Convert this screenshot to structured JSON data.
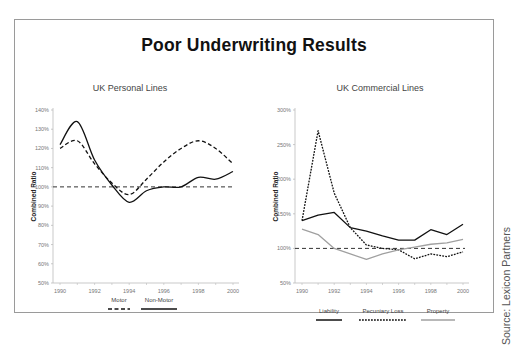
{
  "title": "Poor Underwriting Results",
  "source": "Source: Lexicon Partners",
  "colors": {
    "dark": "#111111",
    "gray": "#a0a0a0",
    "reference": "#333333"
  },
  "chart_data": [
    {
      "type": "line",
      "title": "UK Personal Lines",
      "xlabel": "",
      "ylabel": "Combined Ratio",
      "x": [
        1990,
        1991,
        1992,
        1993,
        1994,
        1995,
        1996,
        1997,
        1998,
        1999,
        2000
      ],
      "xticks": [
        "1990",
        "1992",
        "1994",
        "1996",
        "1998",
        "2000"
      ],
      "yticks": [
        "50%",
        "60%",
        "70%",
        "80%",
        "90%",
        "100%",
        "110%",
        "120%",
        "130%",
        "140%"
      ],
      "ylim": [
        50,
        140
      ],
      "reference_line": 100,
      "grid": false,
      "legend_position": "bottom",
      "series": [
        {
          "name": "Motor",
          "style": "dashed",
          "color": "#111111",
          "values": [
            120,
            124,
            112,
            102,
            96,
            104,
            113,
            120,
            124,
            120,
            112
          ]
        },
        {
          "name": "Non-Motor",
          "style": "solid",
          "color": "#111111",
          "values": [
            122,
            134,
            114,
            101,
            92,
            98,
            100,
            100,
            105,
            104,
            108
          ]
        }
      ]
    },
    {
      "type": "line",
      "title": "UK Commercial Lines",
      "xlabel": "",
      "ylabel": "Combined Ratio",
      "x": [
        1990,
        1991,
        1992,
        1993,
        1994,
        1995,
        1996,
        1997,
        1998,
        1999,
        2000
      ],
      "xticks": [
        "1990",
        "1992",
        "1994",
        "1996",
        "1998",
        "2000"
      ],
      "yticks": [
        "50%",
        "100%",
        "150%",
        "200%",
        "250%",
        "300%"
      ],
      "ylim": [
        50,
        300
      ],
      "reference_line": 100,
      "grid": false,
      "legend_position": "bottom",
      "series": [
        {
          "name": "Liability",
          "style": "solid",
          "color": "#111111",
          "values": [
            140,
            148,
            152,
            130,
            125,
            118,
            112,
            112,
            127,
            120,
            135
          ]
        },
        {
          "name": "Pecuniary Loss",
          "style": "dotted",
          "color": "#111111",
          "values": [
            140,
            270,
            180,
            130,
            105,
            100,
            98,
            85,
            92,
            88,
            95
          ]
        },
        {
          "name": "Property",
          "style": "solid",
          "color": "#a0a0a0",
          "values": [
            128,
            120,
            100,
            92,
            84,
            92,
            98,
            102,
            106,
            108,
            113
          ]
        }
      ]
    }
  ]
}
